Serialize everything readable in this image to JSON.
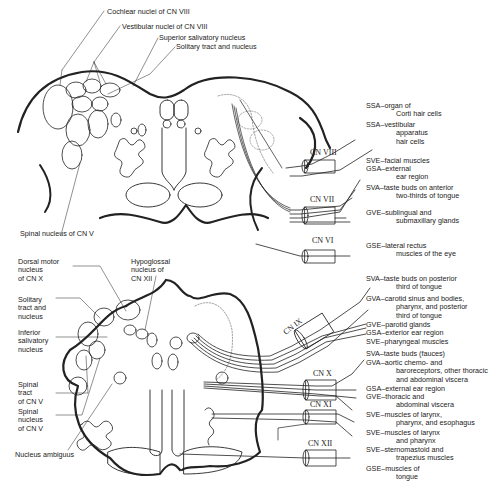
{
  "diagram": {
    "upper_section": {
      "nucleus_labels": [
        "Cochlear nuclei of CN VIII",
        "Vestibular nuclei of CN VIII",
        "Superior salivatory nucleus",
        "Solitary tract and nucleus",
        "Spinal nucleus of CN V"
      ],
      "nerves": [
        {
          "name": "CN VIII"
        },
        {
          "name": "CN VII"
        },
        {
          "name": "CN VI"
        }
      ],
      "components": [
        {
          "code": "SSA",
          "text": "organ of",
          "text2": "Corti hair cells"
        },
        {
          "code": "SSA",
          "text": "vestibular",
          "text2": "apparatus",
          "text3": "hair cells"
        },
        {
          "code": "SVE",
          "text": "facial muscles"
        },
        {
          "code": "GSA",
          "text": "external",
          "text2": "ear region"
        },
        {
          "code": "SVA",
          "text": "taste buds on anterior",
          "text2": "two-thirds of tongue"
        },
        {
          "code": "GVE",
          "text": "sublingual and",
          "text2": "submaxillary glands"
        },
        {
          "code": "GSE",
          "text": "lateral rectus",
          "text2": "muscles of the eye"
        }
      ]
    },
    "lower_section": {
      "nucleus_labels": [
        {
          "l1": "Dorsal motor",
          "l2": "nucleus",
          "l3": "of CN X"
        },
        {
          "l1": "Hypoglossal",
          "l2": "nucleus of",
          "l3": "CN XII"
        },
        {
          "l1": "Solitary",
          "l2": "tract and",
          "l3": "nucleus"
        },
        {
          "l1": "Inferior",
          "l2": "salivatory",
          "l3": "nucleus"
        },
        {
          "l1": "Spinal",
          "l2": "tract",
          "l3": "of CN V"
        },
        {
          "l1": "Spinal",
          "l2": "nucleus",
          "l3": "of CN V"
        },
        {
          "l1": "Nucleus ambiguus"
        }
      ],
      "nerves": [
        {
          "name": "CN IX"
        },
        {
          "name": "CN X"
        },
        {
          "name": "CN XI"
        },
        {
          "name": "CN XII"
        }
      ],
      "components": [
        {
          "code": "SVA",
          "text": "taste buds on posterior",
          "text2": "third of tongue"
        },
        {
          "code": "GVA",
          "text": "carotid sinus and bodies,",
          "text2": "pharynx, and posterior",
          "text3": "third of tongue"
        },
        {
          "code": "GVE",
          "text": "parotid glands"
        },
        {
          "code": "GSA",
          "text": "exterior ear region"
        },
        {
          "code": "SVE",
          "text": "pharyngeal muscles"
        },
        {
          "code": "SVA",
          "text": "taste buds (fauces)"
        },
        {
          "code": "GVA",
          "text": "aortic chemo- and",
          "text2": "baroreceptors, other thoracic",
          "text3": "and abdominal viscera"
        },
        {
          "code": "GSA",
          "text": "external ear region"
        },
        {
          "code": "GVE",
          "text": "thoracic and",
          "text2": "abdominal viscera"
        },
        {
          "code": "SVE",
          "text": "muscles of larynx,",
          "text2": "pharynx, and esophagus"
        },
        {
          "code": "SVE",
          "text": "muscles of larynx",
          "text2": "and pharynx"
        },
        {
          "code": "SVE",
          "text": "sternomastoid and",
          "text2": "trapezius muscles"
        },
        {
          "code": "GSE",
          "text": "muscles of",
          "text2": "tongue"
        }
      ]
    },
    "dash": "–"
  }
}
